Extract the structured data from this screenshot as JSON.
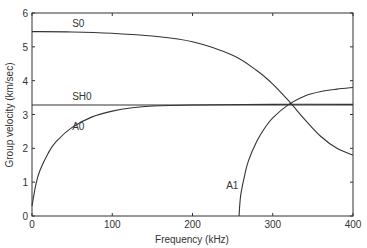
{
  "chart_data": {
    "type": "line",
    "title": "",
    "xlabel": "Frequency (kHz)",
    "ylabel": "Group velocity (km/sec)",
    "xlim": [
      0,
      400
    ],
    "ylim": [
      0,
      6
    ],
    "xticks": [
      0,
      100,
      200,
      300,
      400
    ],
    "yticks": [
      0,
      1,
      2,
      3,
      4,
      5,
      6
    ],
    "grid": false,
    "legend": "inline labels",
    "series": [
      {
        "name": "S0",
        "x": [
          0,
          50,
          100,
          150,
          200,
          250,
          280,
          300,
          320,
          340,
          360,
          380,
          400
        ],
        "values": [
          5.45,
          5.44,
          5.4,
          5.32,
          5.15,
          4.75,
          4.3,
          3.9,
          3.4,
          2.85,
          2.35,
          2.0,
          1.8
        ],
        "label_pos": [
          50,
          5.6
        ]
      },
      {
        "name": "SH0",
        "x": [
          0,
          100,
          200,
          300,
          400
        ],
        "values": [
          3.28,
          3.28,
          3.28,
          3.28,
          3.28
        ],
        "label_pos": [
          50,
          3.42
        ]
      },
      {
        "name": "A0",
        "x": [
          0,
          5,
          10,
          20,
          30,
          50,
          75,
          100,
          125,
          150,
          200,
          300,
          400
        ],
        "values": [
          0.3,
          0.95,
          1.35,
          1.85,
          2.2,
          2.62,
          2.93,
          3.1,
          3.2,
          3.25,
          3.28,
          3.3,
          3.3
        ],
        "label_pos": [
          50,
          2.55
        ]
      },
      {
        "name": "A1",
        "x": [
          258,
          260,
          265,
          270,
          280,
          290,
          300,
          320,
          340,
          360,
          380,
          400
        ],
        "values": [
          0,
          0.6,
          1.2,
          1.65,
          2.2,
          2.6,
          2.9,
          3.3,
          3.55,
          3.68,
          3.75,
          3.8
        ],
        "label_pos": [
          242,
          0.8
        ]
      }
    ]
  }
}
